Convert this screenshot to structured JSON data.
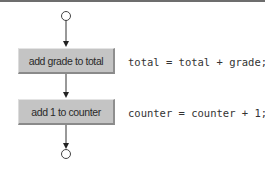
{
  "diagram": {
    "type": "UML activity diagram (sequence structure)",
    "nodes": [
      {
        "id": "initial",
        "kind": "initial-state-circle"
      },
      {
        "id": "action1",
        "kind": "action-state",
        "label": "add grade to total",
        "code": "total = total + grade;"
      },
      {
        "id": "action2",
        "kind": "action-state",
        "label": "add 1 to counter",
        "code": "counter = counter + 1;"
      },
      {
        "id": "final",
        "kind": "final-state-circle"
      }
    ],
    "edges": [
      {
        "from": "initial",
        "to": "action1"
      },
      {
        "from": "action1",
        "to": "action2"
      },
      {
        "from": "action2",
        "to": "final"
      }
    ]
  },
  "boxes": {
    "first_label": "add grade to total",
    "second_label": "add 1 to counter"
  },
  "code": {
    "first_line": "total = total + grade;",
    "second_line": "counter = counter + 1;"
  },
  "colors": {
    "box_fill": "#c4c4c4",
    "line": "#333333",
    "border_top": "#6d6d6d"
  }
}
